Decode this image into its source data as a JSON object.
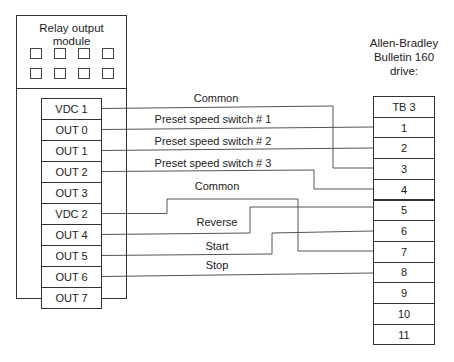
{
  "module": {
    "title_line1": "Relay output",
    "title_line2": "module",
    "indicator_count": 8,
    "terminals": [
      "VDC 1",
      "OUT 0",
      "OUT 1",
      "OUT 2",
      "OUT 3",
      "VDC 2",
      "OUT 4",
      "OUT 5",
      "OUT 6",
      "OUT 7"
    ]
  },
  "drive": {
    "title_line1": "Allen-Bradley",
    "title_line2": "Bulletin 160",
    "title_line3": "drive:",
    "terminals": [
      "TB 3",
      "1",
      "2",
      "3",
      "4",
      "5",
      "6",
      "7",
      "8",
      "9",
      "10",
      "11"
    ]
  },
  "wires": [
    {
      "from": "VDC 1",
      "to": "3",
      "label": "Common"
    },
    {
      "from": "OUT 0",
      "to": "1",
      "label": "Preset speed switch # 1"
    },
    {
      "from": "OUT 1",
      "to": "2",
      "label": "Preset speed switch # 2"
    },
    {
      "from": "OUT 2",
      "to": "4",
      "label": "Preset speed switch # 3"
    },
    {
      "from": "VDC 2",
      "to": "7",
      "label": "Common"
    },
    {
      "from": "OUT 4",
      "to": "5",
      "label": "Reverse"
    },
    {
      "from": "OUT 5",
      "to": "6",
      "label": "Start"
    },
    {
      "from": "OUT 6",
      "to": "8",
      "label": "Stop"
    }
  ],
  "colors": {
    "line": "#555555",
    "border": "#333333"
  }
}
